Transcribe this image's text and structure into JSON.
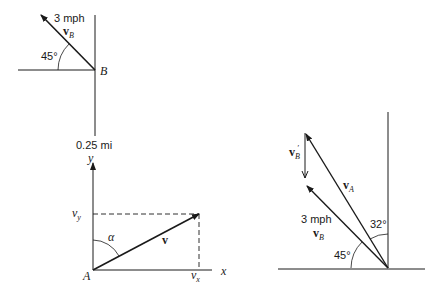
{
  "figure_top_left": {
    "speed_label": "3 mph",
    "vector_label": "v",
    "vector_subscript": "B",
    "angle_label": "45°",
    "point_label": "B",
    "distance_label": "0.25 mi"
  },
  "figure_bottom_left": {
    "y_axis_label": "y",
    "x_axis_label": "x",
    "vy_label": "v",
    "vy_subscript": "y",
    "vx_label": "v",
    "vx_subscript": "x",
    "angle_label": "α",
    "vector_label": "v",
    "origin_label": "A"
  },
  "figure_right": {
    "vb_prime_label": "v",
    "vb_prime_subscript": "B",
    "vb_prime_mark": "′",
    "va_label": "v",
    "va_subscript": "A",
    "speed_label": "3 mph",
    "vb_label": "v",
    "vb_subscript": "B",
    "angle_vertical_label": "32°",
    "angle_horizontal_label": "45°"
  },
  "colors": {
    "line": "#1a1a1a",
    "background": "#ffffff"
  }
}
